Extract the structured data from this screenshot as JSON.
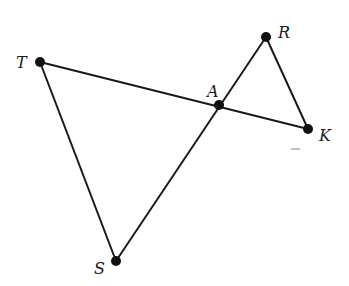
{
  "figure": {
    "points": [
      {
        "id": "T",
        "label": "T"
      },
      {
        "id": "R",
        "label": "R"
      },
      {
        "id": "A",
        "label": "A"
      },
      {
        "id": "K",
        "label": "K"
      },
      {
        "id": "S",
        "label": "S"
      }
    ],
    "segments": [
      {
        "from": "T",
        "to": "K",
        "name": "segment-TK"
      },
      {
        "from": "R",
        "to": "S",
        "name": "segment-RS"
      },
      {
        "from": "T",
        "to": "S",
        "name": "segment-TS"
      },
      {
        "from": "R",
        "to": "K",
        "name": "segment-RK"
      }
    ],
    "colors": {
      "stroke": "#1a1a1a",
      "point": "#111111",
      "background": "#ffffff"
    }
  }
}
